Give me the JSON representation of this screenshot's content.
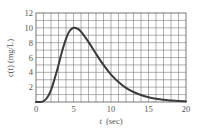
{
  "chart_data": {
    "type": "line",
    "title": "",
    "xlabel": "t (sec)",
    "ylabel": "c(t) (mg/L)",
    "xlim": [
      0,
      20
    ],
    "ylim": [
      0,
      12
    ],
    "grid": true,
    "x_ticks": [
      "0",
      "5",
      "10",
      "15",
      "20"
    ],
    "y_ticks": [
      "2",
      "4",
      "6",
      "8",
      "10",
      "12"
    ],
    "x_grid_step": 1,
    "y_grid_step": 1,
    "series": [
      {
        "name": "c(t)",
        "x": [
          0,
          0.5,
          1,
          1.5,
          2,
          2.5,
          3,
          3.5,
          4,
          4.5,
          5,
          5.5,
          6,
          7,
          8,
          9,
          10,
          11,
          12,
          13,
          14,
          15,
          16,
          17,
          18,
          19,
          20
        ],
        "values": [
          0,
          0,
          0.1,
          0.6,
          1.6,
          3.2,
          5.0,
          6.9,
          8.5,
          9.6,
          10.0,
          9.9,
          9.5,
          8.1,
          6.5,
          5.0,
          3.7,
          2.7,
          1.9,
          1.35,
          0.95,
          0.65,
          0.45,
          0.3,
          0.2,
          0.12,
          0.08
        ]
      }
    ]
  },
  "labels": {
    "xlabel_var": "t",
    "xlabel_unit": "(sec)",
    "ylabel_text": "c(t) (mg/L)"
  }
}
